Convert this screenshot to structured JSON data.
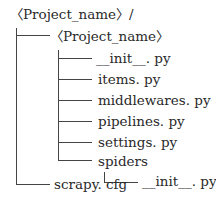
{
  "tree": {
    "root": "〈Project_name〉/",
    "project_dir": "〈Project_name〉",
    "files": {
      "init": "__init__. py",
      "items": "items. py",
      "middlewares": "middlewares. py",
      "pipelines": "pipelines. py",
      "settings": "settings. py",
      "spiders": "spiders",
      "spiders_init": "__init__. py",
      "scrapy_cfg": "scrapy. cfg"
    }
  }
}
